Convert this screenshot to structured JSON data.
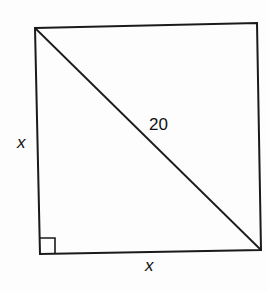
{
  "diagram": {
    "shape": "square",
    "labels": {
      "diagonal": "20",
      "left_side": "x",
      "bottom_side": "x"
    },
    "right_angle_marker": true,
    "colors": {
      "stroke": "#1a1a1a",
      "background": "#fdfdfd"
    }
  }
}
